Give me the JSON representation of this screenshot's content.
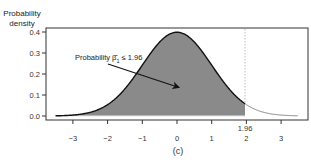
{
  "chart_data": {
    "type": "area",
    "title": "",
    "xlabel": "",
    "ylabel": "Probability density",
    "ylabel_lines": [
      "Probability",
      "density"
    ],
    "caption": "(c)",
    "xlim": [
      -3.6,
      3.6
    ],
    "ylim": [
      0,
      0.42
    ],
    "xticks": [
      -3,
      -2,
      -1,
      0,
      1,
      2,
      3
    ],
    "xtick_labels": [
      "−3",
      "−2",
      "−1",
      "0",
      "1",
      "2",
      "3"
    ],
    "yticks": [
      0.0,
      0.1,
      0.2,
      0.3,
      0.4
    ],
    "ytick_labels": [
      "0.0",
      "0.1",
      "0.2",
      "0.3",
      "0.4"
    ],
    "grid": false,
    "series": [
      {
        "name": "Standard normal density",
        "distribution": "normal",
        "mean": 0,
        "sd": 1,
        "x": [
          -3.5,
          -3,
          -2.5,
          -2,
          -1.5,
          -1,
          -0.5,
          0,
          0.5,
          1,
          1.5,
          1.96,
          2,
          2.5,
          3,
          3.5
        ],
        "values": [
          0.001,
          0.004,
          0.018,
          0.054,
          0.13,
          0.242,
          0.352,
          0.399,
          0.352,
          0.242,
          0.13,
          0.058,
          0.054,
          0.018,
          0.004,
          0.001
        ]
      }
    ],
    "shaded_region": {
      "from": -3.5,
      "to": 1.96,
      "color": "#8a8a8a"
    },
    "reference_line": {
      "x": 1.96,
      "label": "1.96",
      "style": "dotted"
    },
    "annotations": [
      {
        "text": "Probability β̂₁ ≤ 1.96",
        "arrow_to": [
          0,
          0.15
        ]
      }
    ]
  },
  "labels": {
    "annotation_prefix": "Probability ",
    "annotation_beta": "β̂",
    "annotation_sub": "1",
    "annotation_suffix": " ≤ 1.96",
    "ref_label": "1.96"
  },
  "colors": {
    "fill": "#8a8a8a",
    "curve": "#111111",
    "tail_curve": "#777777",
    "axis": "#333333",
    "ref_line": "#bbbbbb"
  }
}
